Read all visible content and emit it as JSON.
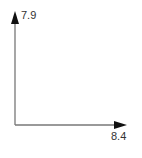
{
  "diagram": {
    "type": "axes",
    "y_axis": {
      "label": "7.9"
    },
    "x_axis": {
      "label": "8.4"
    },
    "colors": {
      "line": "#777777",
      "arrowhead": "#111111",
      "text": "#333333",
      "background": "#ffffff"
    }
  }
}
